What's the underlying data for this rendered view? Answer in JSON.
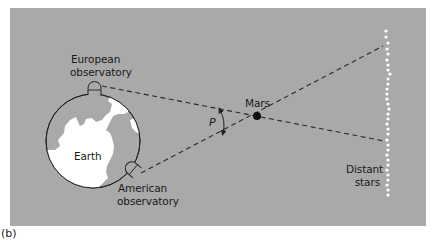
{
  "figure": {
    "caption": "(b)",
    "background_color": "#a9a9a9",
    "line_color": "#2a2a2a",
    "land_color": "#ffffff",
    "star_color": "#ffffff"
  },
  "labels": {
    "european_line1": "European",
    "european_line2": "observatory",
    "american_line1": "American",
    "american_line2": "observatory",
    "earth": "Earth",
    "mars": "Mars",
    "parallax": "P",
    "stars_line1": "Distant",
    "stars_line2": "stars"
  },
  "icons": {
    "earth": "globe-icon",
    "mars": "planet-dot-icon",
    "observatory": "observatory-dome-icon",
    "stars": "star-dot-icon",
    "angle": "double-arrow-arc-icon"
  }
}
